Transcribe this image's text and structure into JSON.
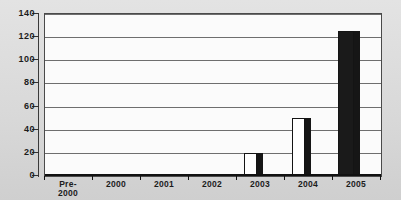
{
  "colors": {
    "page_background": "#d8d8d8",
    "plot_background": "#fbfbfb",
    "gridline": "#6e6e6e",
    "axis": "#111111",
    "text": "#1c1c1c",
    "bar_outline": "#141414",
    "bar_side": "#161616"
  },
  "chart_data": {
    "type": "bar",
    "title": "",
    "xlabel": "",
    "ylabel": "",
    "categories": [
      "Pre-\n2000",
      "2000",
      "2001",
      "2002",
      "2003",
      "2004",
      "2005"
    ],
    "values": [
      0,
      0,
      0,
      0,
      20,
      50,
      125
    ],
    "bar_fills": [
      "#ffffff",
      "#ffffff",
      "#ffffff",
      "#ffffff",
      "#ffffff",
      "#ffffff",
      "#1a1a1a"
    ],
    "ylim": [
      0,
      140
    ],
    "y_ticks": [
      0,
      20,
      40,
      60,
      80,
      100,
      120,
      140
    ],
    "grid": true,
    "legend": false,
    "style": "3d-columns, grayscale scanned look"
  }
}
